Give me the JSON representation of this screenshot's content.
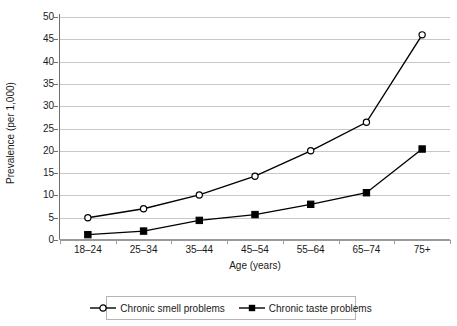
{
  "chart_data": {
    "type": "line",
    "title": "",
    "xlabel": "Age (years)",
    "ylabel": "Prevalence (per 1,000)",
    "categories": [
      "18–24",
      "25–34",
      "35–44",
      "45–54",
      "55–64",
      "65–74",
      "75+"
    ],
    "ylim": [
      0,
      50
    ],
    "yticks": [
      0,
      5,
      10,
      15,
      20,
      25,
      30,
      35,
      40,
      45,
      50
    ],
    "ytick_labels": [
      "0",
      "5",
      "10",
      "15",
      "20",
      "25",
      "30",
      "35",
      "40",
      "45",
      "50"
    ],
    "grid": true,
    "legend_position": "bottom",
    "series": [
      {
        "name": "Chronic smell problems",
        "marker": "open-circle",
        "color": "#000000",
        "values": [
          5.0,
          7.0,
          10.1,
          14.3,
          20.0,
          26.4,
          46.0
        ]
      },
      {
        "name": "Chronic taste problems",
        "marker": "filled-square",
        "color": "#000000",
        "values": [
          1.2,
          2.0,
          4.4,
          5.7,
          8.0,
          10.6,
          20.4
        ]
      }
    ]
  },
  "legend": {
    "entries": [
      {
        "label": "Chronic smell problems"
      },
      {
        "label": "Chronic taste problems"
      }
    ]
  }
}
